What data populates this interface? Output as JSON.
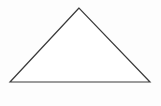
{
  "diagram": {
    "shape": "triangle",
    "vertices": [
      [
        79,
        8
      ],
      [
        10,
        82
      ],
      [
        150,
        82
      ]
    ],
    "stroke": "#3a3a3a",
    "fill": "#ffffff",
    "background": "#fdfdfd"
  }
}
